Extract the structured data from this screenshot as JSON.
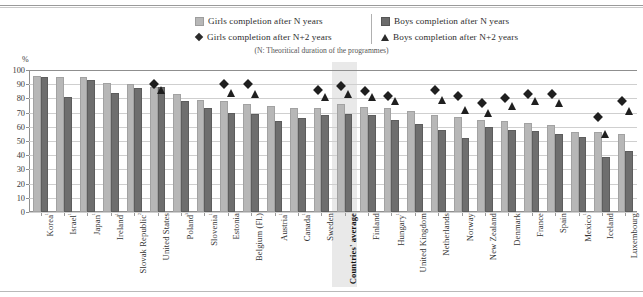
{
  "legend": {
    "items": [
      {
        "marker": "square-light",
        "label": "Girls completion after N years"
      },
      {
        "marker": "square-dark",
        "label": "Boys completion after N years"
      },
      {
        "marker": "diamond",
        "label": "Girls completion after N+2 years"
      },
      {
        "marker": "triangle",
        "label": "Boys completion after N+2 years"
      }
    ]
  },
  "note": "(N: Theoritical duration of the programmes)",
  "axis": {
    "unit": "%"
  },
  "colors": {
    "girls_n": "#b7b7b7",
    "boys_n": "#6e6e6e",
    "marker": "#1f1f1f",
    "highlight_band": "#e9e9e9",
    "gridline": "#cfcfcf",
    "axis": "#8f8f8f"
  },
  "chart_data": {
    "type": "bar",
    "title": "",
    "subtitle": "(N: Theoritical duration of the programmes)",
    "xlabel": "",
    "ylabel": "%",
    "ylim": [
      0,
      100
    ],
    "yticks": [
      0,
      10,
      20,
      30,
      40,
      50,
      60,
      70,
      80,
      90,
      100
    ],
    "grid": true,
    "legend_position": "top-center",
    "highlight_category": "Countries' average",
    "categories": [
      "Korea¹",
      "Israel¹",
      "Japan¹",
      "Ireland¹",
      "Slovak Republic²",
      "United States",
      "Poland³",
      "Slovenia¹",
      "Estonia",
      "Belgium (Fl.)",
      "Austria¹",
      "Canada¹",
      "Sweden",
      "Countries' average",
      "Finland",
      "Hungary¹",
      "United Kingdom",
      "Netherlands",
      "Norway",
      "New Zealand",
      "Denmark",
      "France",
      "Spain",
      "Mexico¹",
      "Iceland",
      "Luxembourg"
    ],
    "series": [
      {
        "name": "Girls completion after N years",
        "marker": "bar-light",
        "values": [
          96,
          95,
          95,
          91,
          90,
          88,
          83,
          79,
          78,
          76,
          75,
          73,
          73,
          76,
          74,
          73,
          71,
          68,
          67,
          65,
          64,
          63,
          61,
          56,
          56,
          55
        ]
      },
      {
        "name": "Boys completion after N years",
        "marker": "bar-dark",
        "values": [
          95,
          81,
          93,
          84,
          87,
          88,
          78,
          73,
          70,
          69,
          64,
          66,
          68,
          69,
          68,
          65,
          62,
          58,
          52,
          60,
          58,
          57,
          55,
          53,
          39,
          43
        ]
      },
      {
        "name": "Girls completion after N+2 years",
        "marker": "diamond",
        "values": [
          null,
          null,
          null,
          null,
          null,
          90,
          null,
          null,
          90,
          90,
          null,
          null,
          86,
          89,
          85,
          82,
          null,
          86,
          82,
          77,
          80,
          83,
          83,
          null,
          67,
          78
        ]
      },
      {
        "name": "Boys completion after N+2 years",
        "marker": "triangle",
        "values": [
          null,
          null,
          null,
          null,
          null,
          86,
          null,
          null,
          84,
          83,
          null,
          null,
          81,
          83,
          81,
          78,
          null,
          79,
          72,
          70,
          75,
          78,
          77,
          null,
          55,
          71
        ]
      }
    ]
  }
}
